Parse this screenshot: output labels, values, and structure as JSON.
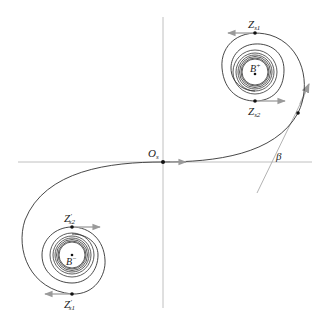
{
  "diagram": {
    "labels": {
      "origin": "O",
      "origin_sub": "s",
      "z_s1": "Z",
      "z_s1_sub": "s1",
      "z_s2": "Z",
      "z_s2_sub": "s2",
      "b_plus": "B",
      "b_plus_sup": "+",
      "b_minus": "B",
      "b_minus_sup": "−",
      "z_s1_prime": "Z",
      "z_s1_prime_sub": "s1",
      "z_s2_prime": "Z",
      "z_s2_prime_sub": "s2",
      "prime": "′",
      "beta": "β"
    },
    "colors": {
      "curve": "#333333",
      "axis": "#aaaaaa",
      "arrow": "#9a9a9a",
      "dot": "#111111"
    }
  }
}
